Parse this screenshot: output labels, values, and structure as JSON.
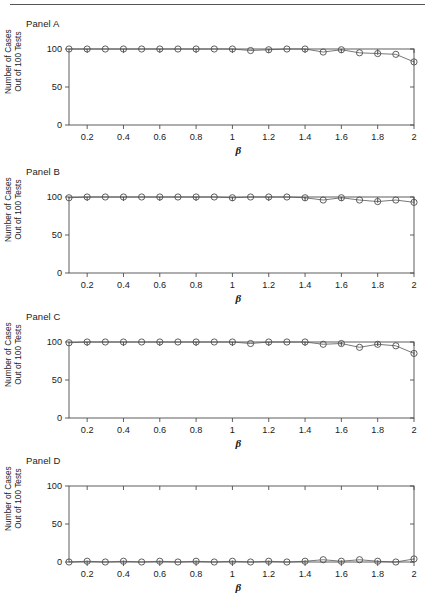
{
  "figure": {
    "panels": [
      {
        "label": "Panel A",
        "ylabel_line1": "Number of Cases",
        "ylabel_line2": "Out of 100 Tests",
        "xlabel": "β"
      },
      {
        "label": "Panel B",
        "ylabel_line1": "Number of Cases",
        "ylabel_line2": "Out of 100 Tests",
        "xlabel": "β"
      },
      {
        "label": "Panel C",
        "ylabel_line1": "Number of Cases",
        "ylabel_line2": "Out of 100 Tests",
        "xlabel": "β"
      },
      {
        "label": "Panel D",
        "ylabel_line1": "Number of Cases",
        "ylabel_line2": "Out of 100 Tests",
        "xlabel": "β"
      }
    ]
  },
  "chart_data": [
    {
      "type": "line",
      "title": "Panel A",
      "xlabel": "β",
      "ylabel": "Number of Cases Out of 100 Tests",
      "xlim": [
        0.1,
        2.0
      ],
      "ylim": [
        0,
        100
      ],
      "xticks": [
        0.2,
        0.4,
        0.6,
        0.8,
        1,
        1.2,
        1.4,
        1.6,
        1.8,
        2
      ],
      "xticklabels": [
        "0.2",
        "0.4",
        "0.6",
        "0.8",
        "1",
        "1.2",
        "1.4",
        "1.6",
        "1.8",
        "2"
      ],
      "yticks": [
        0,
        50,
        100
      ],
      "yticklabels": [
        "0",
        "50",
        "100"
      ],
      "grid": false,
      "legend": "none",
      "marker": "open-circle",
      "errorbars": true,
      "x": [
        0.1,
        0.2,
        0.3,
        0.4,
        0.5,
        0.6,
        0.7,
        0.8,
        0.9,
        1.0,
        1.1,
        1.2,
        1.3,
        1.4,
        1.5,
        1.6,
        1.7,
        1.8,
        1.9,
        2.0
      ],
      "values": [
        100,
        100,
        100,
        100,
        100,
        100,
        100,
        100,
        100,
        100,
        98,
        99,
        100,
        100,
        96,
        99,
        95,
        94,
        93,
        83
      ],
      "errors": [
        1,
        1.5,
        0,
        1.5,
        0,
        1.5,
        0,
        1.5,
        0,
        1.5,
        0,
        1.5,
        0,
        2,
        0,
        2,
        0,
        2,
        0,
        2.5
      ]
    },
    {
      "type": "line",
      "title": "Panel B",
      "xlabel": "β",
      "ylabel": "Number of Cases Out of 100 Tests",
      "xlim": [
        0.1,
        2.0
      ],
      "ylim": [
        0,
        100
      ],
      "xticks": [
        0.2,
        0.4,
        0.6,
        0.8,
        1,
        1.2,
        1.4,
        1.6,
        1.8,
        2
      ],
      "xticklabels": [
        "0.2",
        "0.4",
        "0.6",
        "0.8",
        "1",
        "1.2",
        "1.4",
        "1.6",
        "1.8",
        "2"
      ],
      "yticks": [
        0,
        50,
        100
      ],
      "yticklabels": [
        "0",
        "50",
        "100"
      ],
      "grid": false,
      "legend": "none",
      "marker": "open-circle",
      "errorbars": true,
      "x": [
        0.1,
        0.2,
        0.3,
        0.4,
        0.5,
        0.6,
        0.7,
        0.8,
        0.9,
        1.0,
        1.1,
        1.2,
        1.3,
        1.4,
        1.5,
        1.6,
        1.7,
        1.8,
        1.9,
        2.0
      ],
      "values": [
        99,
        100,
        100,
        100,
        100,
        100,
        100,
        100,
        100,
        99,
        100,
        100,
        100,
        99,
        96,
        99,
        96,
        94,
        96,
        93
      ],
      "errors": [
        1,
        1.5,
        0,
        1.5,
        0,
        1.5,
        0,
        1.5,
        0,
        1.5,
        0,
        1.5,
        0,
        2,
        0,
        2,
        0,
        2,
        0,
        2
      ]
    },
    {
      "type": "line",
      "title": "Panel C",
      "xlabel": "β",
      "ylabel": "Number of Cases Out of 100 Tests",
      "xlim": [
        0.1,
        2.0
      ],
      "ylim": [
        0,
        100
      ],
      "xticks": [
        0.2,
        0.4,
        0.6,
        0.8,
        1,
        1.2,
        1.4,
        1.6,
        1.8,
        2
      ],
      "xticklabels": [
        "0.2",
        "0.4",
        "0.6",
        "0.8",
        "1",
        "1.2",
        "1.4",
        "1.6",
        "1.8",
        "2"
      ],
      "yticks": [
        0,
        50,
        100
      ],
      "yticklabels": [
        "0",
        "50",
        "100"
      ],
      "grid": false,
      "legend": "none",
      "marker": "open-circle",
      "errorbars": true,
      "x": [
        0.1,
        0.2,
        0.3,
        0.4,
        0.5,
        0.6,
        0.7,
        0.8,
        0.9,
        1.0,
        1.1,
        1.2,
        1.3,
        1.4,
        1.5,
        1.6,
        1.7,
        1.8,
        1.9,
        2.0
      ],
      "values": [
        99,
        100,
        100,
        100,
        100,
        100,
        100,
        100,
        100,
        100,
        98,
        100,
        100,
        100,
        97,
        98,
        93,
        97,
        95,
        85
      ],
      "errors": [
        1,
        1.5,
        0,
        1.5,
        0,
        1.5,
        0,
        1.5,
        0,
        2,
        0,
        1.5,
        0,
        2,
        0,
        2,
        0,
        2,
        0,
        2.5
      ]
    },
    {
      "type": "line",
      "title": "Panel D",
      "xlabel": "β",
      "ylabel": "Number of Cases Out of 100 Tests",
      "xlim": [
        0.1,
        2.0
      ],
      "ylim": [
        0,
        100
      ],
      "xticks": [
        0.2,
        0.4,
        0.6,
        0.8,
        1,
        1.2,
        1.4,
        1.6,
        1.8,
        2
      ],
      "xticklabels": [
        "0.2",
        "0.4",
        "0.6",
        "0.8",
        "1",
        "1.2",
        "1.4",
        "1.6",
        "1.8",
        "2"
      ],
      "yticks": [
        0,
        50,
        100
      ],
      "yticklabels": [
        "0",
        "50",
        "100"
      ],
      "grid": false,
      "legend": "none",
      "marker": "open-circle",
      "errorbars": true,
      "x": [
        0.1,
        0.2,
        0.3,
        0.4,
        0.5,
        0.6,
        0.7,
        0.8,
        0.9,
        1.0,
        1.1,
        1.2,
        1.3,
        1.4,
        1.5,
        1.6,
        1.7,
        1.8,
        1.9,
        2.0
      ],
      "values": [
        0,
        1,
        0,
        1,
        0,
        1,
        0,
        1,
        0,
        1,
        0,
        1,
        0,
        1,
        3,
        1,
        3,
        1,
        0,
        4
      ],
      "errors": [
        0.5,
        1,
        0,
        1,
        0,
        1,
        0,
        1,
        0,
        1,
        0,
        1,
        0,
        1.5,
        0,
        1.5,
        0,
        1.5,
        0,
        1.5
      ]
    }
  ],
  "style": {
    "axis_color": "#4d4d4d",
    "line_color": "#555555",
    "marker_color": "#4d4d4d",
    "text_color": "#1a1a1a",
    "background": "#ffffff"
  }
}
